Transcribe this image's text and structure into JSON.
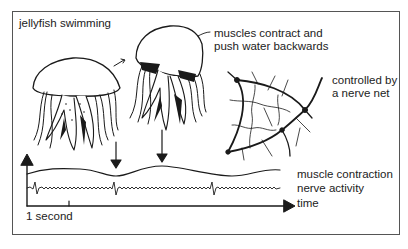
{
  "figure": {
    "title": "jellyfish swimming",
    "annotations": {
      "muscles_line1": "muscles contract and",
      "muscles_line2": "push water backwards",
      "nerve_net_line1": "controlled by",
      "nerve_net_line2": "a nerve net"
    },
    "traces": {
      "muscle": "muscle contraction",
      "nerve": "nerve activity",
      "time": "time",
      "scale": "1 second"
    }
  },
  "colors": {
    "ink": "#1a1a1a",
    "border": "#555555",
    "background": "#ffffff"
  }
}
